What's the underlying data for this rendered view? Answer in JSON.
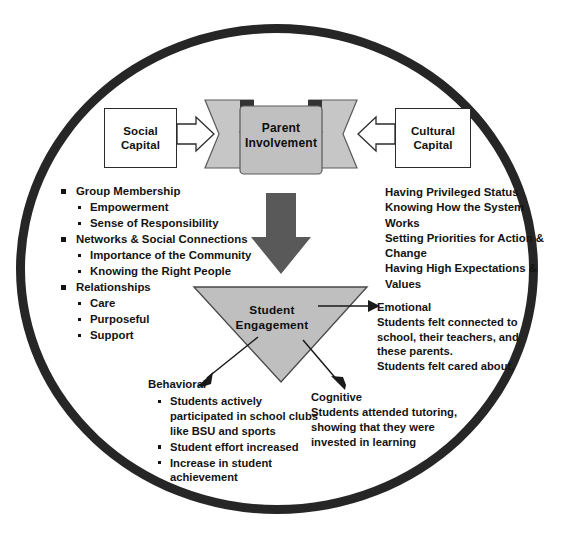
{
  "diagram": {
    "colors": {
      "circle_outline": "#262626",
      "ribbon_fill": "#c0c0c0",
      "ribbon_wing_fill": "#c8c8c8",
      "ribbon_fold": "#3a3a3a",
      "down_arrow_fill": "#585858",
      "triangle_fill": "#bfbfbf",
      "box_fill": "#ffffff",
      "box_outline": "#2b2b2b",
      "text": "#131313"
    },
    "inputs": {
      "left_box": {
        "name": "social-capital",
        "lines": [
          "Social",
          "Capital"
        ],
        "arrow": "right-block-arrow"
      },
      "right_box": {
        "name": "cultural-capital",
        "lines": [
          "Cultural",
          "Capital"
        ],
        "arrow": "left-block-arrow"
      }
    },
    "center_node": {
      "name": "parent-involvement",
      "lines": [
        "Parent",
        "Involvement"
      ],
      "shape": "ribbon-banner"
    },
    "flow_arrow": {
      "name": "down-arrow",
      "direction": "down"
    },
    "outcome_node": {
      "name": "student-engagement",
      "lines": [
        "Student",
        "Engagement"
      ],
      "shape": "inverted-triangle"
    },
    "left_list": [
      {
        "label": "Group Membership",
        "children": [
          "Empowerment",
          "Sense of Responsibility"
        ]
      },
      {
        "label": "Networks & Social Connections",
        "children": [
          "Importance of the Community",
          "Knowing the Right People"
        ]
      },
      {
        "label": "Relationships",
        "children": [
          "Care",
          "Purposeful",
          "Support"
        ]
      }
    ],
    "right_capital_text": [
      "Having Privileged Status",
      "Knowing How the System Works",
      "Setting Priorities for Action & Change",
      "Having High Expectations & Values"
    ],
    "branches": {
      "emotional": {
        "heading": "Emotional",
        "body": [
          "Students felt connected to school, their teachers, and these parents.",
          "Students felt cared about."
        ]
      },
      "behavioral": {
        "heading": "Behavioral",
        "items": [
          "Students actively participated in school clubs like BSU and sports",
          "Student effort increased",
          "Increase in student achievement"
        ]
      },
      "cognitive": {
        "heading": "Cognitive",
        "body": [
          "Students attended tutoring, showing that they were invested in learning"
        ]
      }
    }
  }
}
